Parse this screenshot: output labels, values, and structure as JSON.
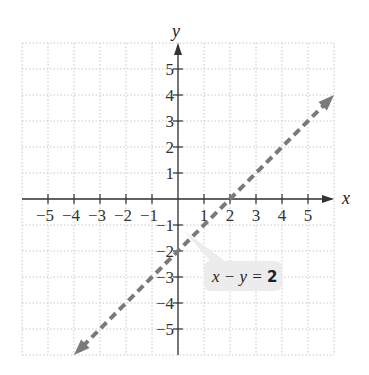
{
  "chart_data": {
    "type": "line",
    "title": "",
    "xlabel": "x",
    "ylabel": "y",
    "xlim": [
      -6,
      6
    ],
    "ylim": [
      -6,
      6
    ],
    "grid": true,
    "x_ticks": [
      -5,
      -4,
      -3,
      -2,
      -1,
      1,
      2,
      3,
      4,
      5
    ],
    "y_ticks": [
      -5,
      -4,
      -3,
      -2,
      -1,
      1,
      2,
      3,
      4,
      5
    ],
    "x_tick_labels": [
      "−5",
      "−4",
      "−3",
      "−2",
      "−1",
      "1",
      "2",
      "3",
      "4",
      "5"
    ],
    "y_tick_labels": [
      "−5",
      "−4",
      "−3",
      "−2",
      "−1",
      "1",
      "2",
      "3",
      "4",
      "5"
    ],
    "series": [
      {
        "name": "x − y = 2",
        "style": "dashed",
        "arrows": "both",
        "color": "#7a7a7a",
        "x": [
          -4,
          0,
          2,
          6
        ],
        "y": [
          -6,
          -2,
          0,
          4
        ]
      }
    ],
    "annotations": [
      {
        "text": "x − y = 2",
        "x": 3,
        "y": -3,
        "box": true
      }
    ],
    "intercepts": {
      "x_intercept": [
        2,
        0
      ],
      "y_intercept": [
        0,
        -2
      ]
    }
  },
  "labels": {
    "x_axis": "x",
    "y_axis": "y",
    "equation_lhs": "x − y = ",
    "equation_rhs": "2"
  },
  "colors": {
    "grid": "#c8c8c8",
    "axis": "#333333",
    "line": "#7a7a7a",
    "label_box": "#ececec"
  }
}
